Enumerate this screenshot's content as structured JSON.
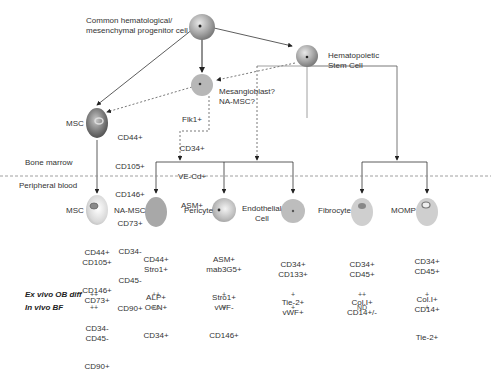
{
  "top_nodes": {
    "common_progenitor": {
      "label_line1": "Common hematological/",
      "label_line2": "mesenchymal progenitor cell"
    },
    "hsc": {
      "label_line1": "Hematopoietic",
      "label_line2": "Stem Cell"
    },
    "mesangioblast": {
      "label_line1": "Mesangioblast?",
      "label_line2": "NA-MSC?",
      "markers": [
        "Flk1+",
        "CD34+",
        "VE-Cd+",
        "ASM+"
      ]
    },
    "msc_marrow": {
      "label": "MSC",
      "markers": [
        "CD44+",
        "CD105+",
        "CD146+",
        "CD73+",
        "CD34-",
        "CD45-",
        "CD90+"
      ]
    }
  },
  "regions": {
    "bone_marrow": "Bone marrow",
    "peripheral_blood": "Peripheral blood"
  },
  "blood_cells": [
    {
      "label": "MSC",
      "markers": [
        "CD44+",
        "CD105+",
        "CD146+",
        "CD73+",
        "CD34-",
        "CD45-",
        "CD90+"
      ],
      "ex_vivo": "++",
      "in_vivo": "++"
    },
    {
      "label": "NA-MSC",
      "markers": [
        "CD44+",
        "Stro1+",
        "ALP+",
        "OCN+",
        "CD34+"
      ],
      "ex_vivo": "++",
      "in_vivo": "+/-"
    },
    {
      "label": "Pericyte",
      "markers": [
        "ASM+",
        "mab3G5+",
        "Stro1+",
        "vWF-",
        "CD146+"
      ],
      "ex_vivo": "+",
      "in_vivo": "+"
    },
    {
      "label_line1": "Endothelial",
      "label_line2": "Cell",
      "markers": [
        "CD34+",
        "CD133+",
        "Tie-2+",
        "vWF+"
      ],
      "ex_vivo": "+",
      "in_vivo": "+"
    },
    {
      "label": "Fibrocyte",
      "markers": [
        "CD34+",
        "CD45+",
        "Col.I+",
        "CD14+/-"
      ],
      "ex_vivo": "++",
      "in_vivo": "ND"
    },
    {
      "label": "MOMP",
      "markers": [
        "CD34+",
        "CD45+",
        "Col.I+",
        "CD14+",
        "Tie-2+"
      ],
      "ex_vivo": "+",
      "in_vivo": "+"
    }
  ],
  "rows": {
    "ex_vivo_label": "Ex vivo OB diff",
    "in_vivo_label": "In vivo BF"
  }
}
